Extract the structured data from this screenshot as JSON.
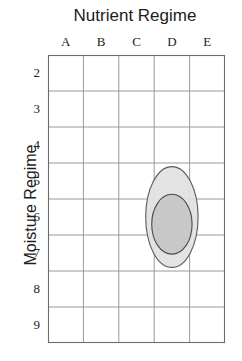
{
  "chart_data": {
    "type": "scatter",
    "title": "Nutrient Regime",
    "xlabel": "Nutrient Regime",
    "ylabel": "Moisture Regime",
    "categories": [
      "A",
      "B",
      "C",
      "D",
      "E"
    ],
    "y_tick_labels": [
      "2",
      "3",
      "4",
      "5",
      "6",
      "7",
      "8",
      "9"
    ],
    "xlim": [
      0,
      5
    ],
    "ylim": [
      1.5,
      9.5
    ],
    "grid": true,
    "legend": false,
    "series": [
      {
        "name": "outer-ellipse",
        "shape": "ellipse",
        "center_x": "D",
        "center_y": 6.0,
        "x_radius_cols": 0.74,
        "y_radius_rows": 1.4,
        "fill": "#e2e2e2",
        "stroke": "#5a5a5a"
      },
      {
        "name": "inner-ellipse",
        "shape": "ellipse",
        "center_x": "D",
        "center_y": 6.2,
        "x_radius_cols": 0.57,
        "y_radius_rows": 0.83,
        "fill": "#c6c6c6",
        "stroke": "#4a4a4a"
      }
    ]
  },
  "chart": {
    "title": "Nutrient Regime",
    "y_axis_label": "Moisture Regime",
    "columns": [
      "A",
      "B",
      "C",
      "D",
      "E"
    ],
    "rows": [
      "2",
      "3",
      "4",
      "5",
      "6",
      "7",
      "8",
      "9"
    ]
  },
  "colors": {
    "grid_line": "#8f8f8f",
    "border": "#6b6b6b",
    "outer_ellipse_fill": "#e2e2e2",
    "outer_ellipse_stroke": "#5a5a5a",
    "inner_ellipse_fill": "#c6c6c6",
    "inner_ellipse_stroke": "#4a4a4a",
    "text": "#1c1c1c",
    "background": "#ffffff"
  }
}
